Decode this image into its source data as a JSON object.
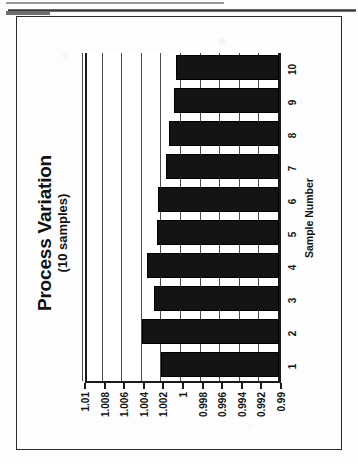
{
  "document": {
    "page_rules": [
      "top-thin-rule",
      "main-heavy-rule",
      "left-stub-rule"
    ]
  },
  "figure": {
    "frame_label": "figure-border",
    "orientation": "rotated-90-ccw"
  },
  "chart_data": {
    "type": "bar",
    "orientation": "horizontal-on-page",
    "title": "Process Variation",
    "subtitle": "(10 samples)",
    "xlabel": "Sample Number",
    "ylabel": "",
    "categories": [
      "1",
      "2",
      "3",
      "4",
      "5",
      "6",
      "7",
      "8",
      "9",
      "10"
    ],
    "values": [
      1.002,
      1.004,
      1.0028,
      1.0035,
      1.0025,
      1.0023,
      1.0015,
      1.0012,
      1.0007,
      1.0005
    ],
    "ylim": [
      0.99,
      1.01
    ],
    "yticks": [
      0.99,
      0.992,
      0.994,
      0.996,
      0.998,
      1,
      1.002,
      1.004,
      1.006,
      1.008,
      1.01
    ],
    "ytick_labels": [
      "0.99",
      "0.992",
      "0.994",
      "0.996",
      "0.998",
      "1",
      "1.002",
      "1.004",
      "1.006",
      "1.008",
      "1.01"
    ],
    "baseline": 0.99,
    "grid": true,
    "grid_axis": "value",
    "legend": null,
    "bar_color": "#141414",
    "axis_color": "#1a1a1a",
    "grid_color": "#4a4a4a",
    "plot_background": "#ffffff"
  }
}
